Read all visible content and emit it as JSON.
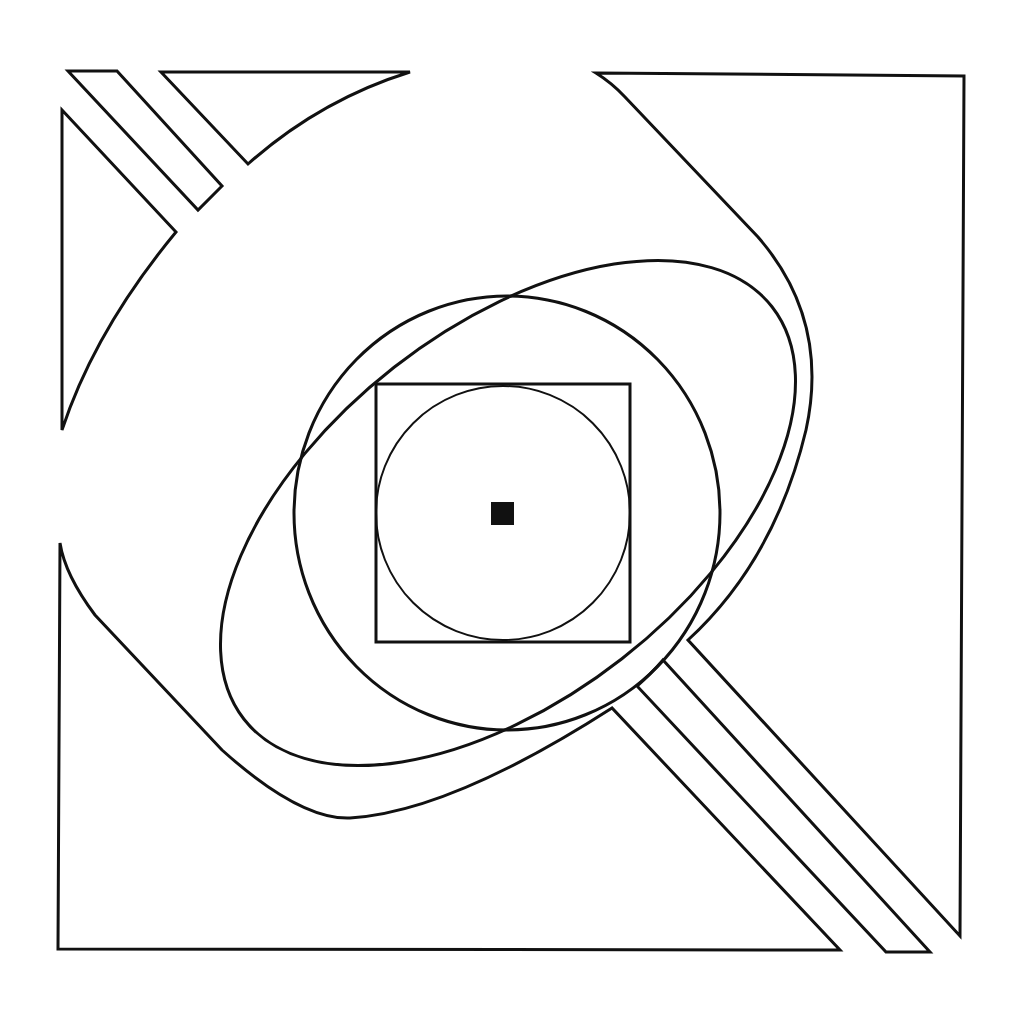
{
  "figure": {
    "title": "",
    "colors": {
      "background": "#ffffff",
      "stroke": "#111111",
      "fill": "#111111"
    },
    "elements": [
      {
        "name": "outer-frame",
        "type": "composite-polygons"
      },
      {
        "name": "diagonal-bands-top-left",
        "type": "strips",
        "count": 1
      },
      {
        "name": "diagonal-bands-bottom-right",
        "type": "strips",
        "count": 2
      },
      {
        "name": "large-tilted-ellipse",
        "type": "ellipse",
        "cx": 508,
        "cy": 513,
        "rx": 335,
        "ry": 185,
        "rotation_deg": -38
      },
      {
        "name": "middle-circle",
        "type": "ellipse",
        "cx": 507,
        "cy": 513,
        "rx": 213,
        "ry": 217
      },
      {
        "name": "inner-square",
        "type": "rect",
        "x": 376,
        "y": 384,
        "w": 254,
        "h": 258
      },
      {
        "name": "inscribed-circle",
        "type": "circle",
        "cx": 503,
        "cy": 513,
        "r": 127
      },
      {
        "name": "center-square",
        "type": "rect",
        "x": 491,
        "y": 502,
        "w": 23,
        "h": 23
      }
    ]
  }
}
